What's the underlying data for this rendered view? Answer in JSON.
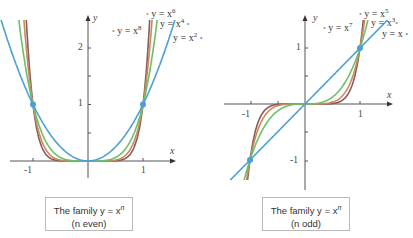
{
  "chart_data": [
    {
      "type": "line",
      "title": "The family y = x^n (n even)",
      "caption_line1": "The family y = x",
      "caption_exp": "n",
      "caption_line2": "(n even)",
      "xlabel": "x",
      "ylabel": "y",
      "xticks": [
        "-1",
        "1"
      ],
      "yticks": [
        "1",
        "2"
      ],
      "xlim": [
        -1.6,
        1.6
      ],
      "ylim": [
        -0.5,
        2.5
      ],
      "points_marked": [
        [
          -1,
          1
        ],
        [
          1,
          1
        ]
      ],
      "series": [
        {
          "name": "y = x^2",
          "label": "y = x",
          "exp": "2",
          "color": "#4d9fd6"
        },
        {
          "name": "y = x^4",
          "label": "y = x",
          "exp": "4",
          "color": "#6cbf6a"
        },
        {
          "name": "y = x^6",
          "label": "y = x",
          "exp": "6",
          "color": "#c98a5a"
        },
        {
          "name": "y = x^8",
          "label": "y = x",
          "exp": "8",
          "color": "#8a5a5a"
        }
      ]
    },
    {
      "type": "line",
      "title": "The family y = x^n (n odd)",
      "caption_line1": "The family y = x",
      "caption_exp": "n",
      "caption_line2": "(n odd)",
      "xlabel": "x",
      "ylabel": "y",
      "xticks": [
        "-1",
        "1"
      ],
      "yticks": [
        "-1",
        "1"
      ],
      "xlim": [
        -1.6,
        1.6
      ],
      "ylim": [
        -1.5,
        1.5
      ],
      "points_marked": [
        [
          -1,
          -1
        ],
        [
          1,
          1
        ]
      ],
      "series": [
        {
          "name": "y = x",
          "label": "y = x",
          "exp": "",
          "color": "#4d9fd6"
        },
        {
          "name": "y = x^3",
          "label": "y = x",
          "exp": "3",
          "color": "#6cbf6a"
        },
        {
          "name": "y = x^5",
          "label": "y = x",
          "exp": "5",
          "color": "#c98a5a"
        },
        {
          "name": "y = x^7",
          "label": "y = x",
          "exp": "7",
          "color": "#8a5a5a"
        }
      ]
    }
  ]
}
